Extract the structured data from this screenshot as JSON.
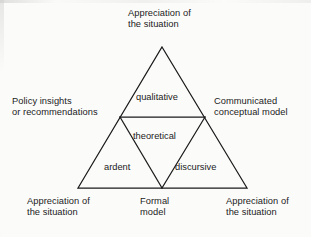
{
  "figure": {
    "type": "triangle-subdivision-diagram",
    "background_color": "#fbfbfa",
    "line_color": "#1a1a1a",
    "text_color": "#1c1c1c"
  },
  "outer_labels": {
    "top": "Appreciation of\nthe situation",
    "left": "Policy insights\nor recommendations",
    "right": "Communicated\nconceptual model",
    "bottom_left": "Appreciation of\nthe situation",
    "bottom_middle": "Formal\nmodel",
    "bottom_right": "Appreciation of\nthe situation"
  },
  "inner_labels": {
    "top": "qualitative",
    "center": "theoretical",
    "bottom_left": "ardent",
    "bottom_right": "discursive"
  },
  "geometry": {
    "apex": "162,47",
    "base_left": "78,188",
    "base_right": "247,188",
    "mid_left": "120,117",
    "mid_right": "205,117",
    "mid_base": "162,188"
  }
}
